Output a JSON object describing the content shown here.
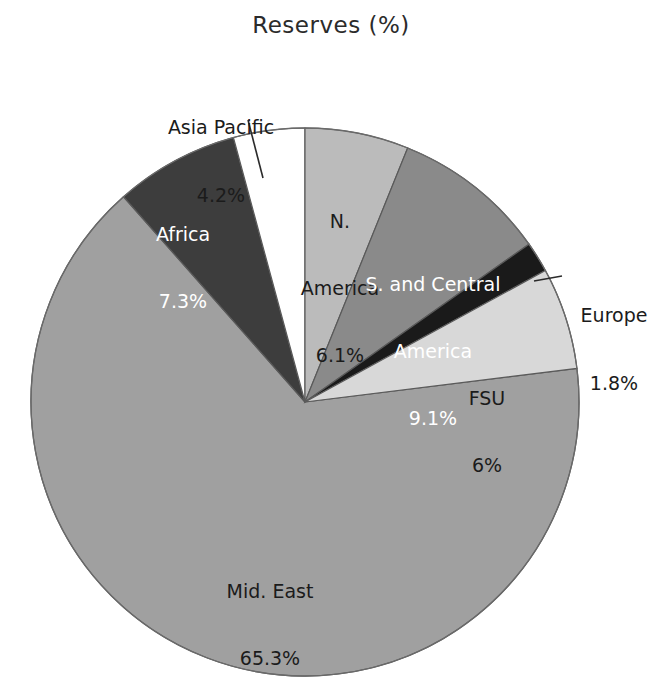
{
  "chart_data": {
    "type": "pie",
    "title": "Reserves (%)",
    "xlabel": "",
    "ylabel": "",
    "legend": "none",
    "grid": false,
    "start_angle_deg": 0,
    "direction": "clockwise",
    "categories": [
      "N. America",
      "S. and Central America",
      "Europe",
      "FSU",
      "Mid. East",
      "Africa",
      "Asia Pacific"
    ],
    "values": [
      6.1,
      9.1,
      1.8,
      6,
      65.3,
      7.3,
      4.2
    ],
    "value_labels": [
      "6.1%",
      "9.1%",
      "1.8%",
      "6%",
      "65.3%",
      "7.3%",
      "4.2%"
    ],
    "slices": [
      {
        "id": "n-america",
        "name": "N. America",
        "name_lines": [
          "N.",
          "America"
        ],
        "value": 6.1,
        "value_label": "6.1%",
        "color": "#bbbbbb",
        "text_color": "#1b1b1b",
        "label_placement": "inside"
      },
      {
        "id": "s-c-america",
        "name": "S. and Central America",
        "name_lines": [
          "S. and Central",
          "America"
        ],
        "value": 9.1,
        "value_label": "9.1%",
        "color": "#8a8a8a",
        "text_color": "#ffffff",
        "label_placement": "inside"
      },
      {
        "id": "europe",
        "name": "Europe",
        "name_lines": [
          "Europe"
        ],
        "value": 1.8,
        "value_label": "1.8%",
        "color": "#1a1a1a",
        "text_color": "#1b1b1b",
        "label_placement": "outside-right"
      },
      {
        "id": "fsu",
        "name": "FSU",
        "name_lines": [
          "FSU"
        ],
        "value": 6,
        "value_label": "6%",
        "color": "#d8d8d8",
        "text_color": "#1b1b1b",
        "label_placement": "inside"
      },
      {
        "id": "mid-east",
        "name": "Mid. East",
        "name_lines": [
          "Mid. East"
        ],
        "value": 65.3,
        "value_label": "65.3%",
        "color": "#a0a0a0",
        "text_color": "#1b1b1b",
        "label_placement": "inside"
      },
      {
        "id": "africa",
        "name": "Africa",
        "name_lines": [
          "Africa"
        ],
        "value": 7.3,
        "value_label": "7.3%",
        "color": "#3d3d3d",
        "text_color": "#ffffff",
        "label_placement": "inside"
      },
      {
        "id": "asia-pacific",
        "name": "Asia Pacific",
        "name_lines": [
          "Asia Pacific"
        ],
        "value": 4.2,
        "value_label": "4.2%",
        "color": "#ffffff",
        "text_color": "#1b1b1b",
        "label_placement": "outside-top"
      }
    ],
    "geometry": {
      "center_x": 305,
      "center_y": 402,
      "radius": 274,
      "outline_color": "#555555"
    }
  },
  "labels": {
    "n_america": {
      "name": "N.",
      "name2": "America",
      "value": "6.1%"
    },
    "s_c_america": {
      "name": "S. and Central",
      "name2": "America",
      "value": "9.1%"
    },
    "europe": {
      "name": "Europe",
      "value": "1.8%"
    },
    "fsu": {
      "name": "FSU",
      "value": "6%"
    },
    "mid_east": {
      "name": "Mid. East",
      "value": "65.3%"
    },
    "africa": {
      "name": "Africa",
      "value": "7.3%"
    },
    "asia_pacific": {
      "name": "Asia Pacific",
      "value": "4.2%"
    }
  }
}
